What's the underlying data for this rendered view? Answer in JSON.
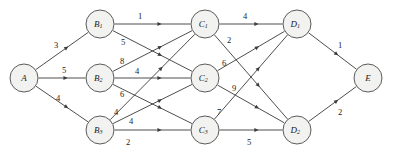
{
  "diagram": {
    "kind": "flow-network",
    "background_color": "#ffffff",
    "node_fill_color": "#f2f2f0",
    "node_stroke_color": "#4a4a4a",
    "edge_color": "#3a3a3a",
    "label_color": "#1a1a1a",
    "nodes": [
      {
        "id": "A",
        "base": "A",
        "subscript": "",
        "label": "A",
        "cx": 24,
        "cy": 78,
        "r": 14,
        "role": "source"
      },
      {
        "id": "B1",
        "base": "B",
        "subscript": "1",
        "label": "B1",
        "cx": 100,
        "cy": 24,
        "r": 14,
        "role": "intermediate"
      },
      {
        "id": "B2",
        "base": "B",
        "subscript": "2",
        "label": "B2",
        "cx": 100,
        "cy": 78,
        "r": 14,
        "role": "intermediate"
      },
      {
        "id": "B3",
        "base": "B",
        "subscript": "3",
        "label": "B3",
        "cx": 100,
        "cy": 130,
        "r": 14,
        "role": "intermediate"
      },
      {
        "id": "C1",
        "base": "C",
        "subscript": "1",
        "label": "C1",
        "cx": 205,
        "cy": 24,
        "r": 14,
        "role": "intermediate"
      },
      {
        "id": "C2",
        "base": "C",
        "subscript": "2",
        "label": "C2",
        "cx": 205,
        "cy": 78,
        "r": 14,
        "role": "intermediate"
      },
      {
        "id": "C3",
        "base": "C",
        "subscript": "3",
        "label": "C3",
        "cx": 205,
        "cy": 130,
        "r": 14,
        "role": "intermediate"
      },
      {
        "id": "D1",
        "base": "D",
        "subscript": "1",
        "label": "D1",
        "cx": 297,
        "cy": 24,
        "r": 14,
        "role": "intermediate"
      },
      {
        "id": "D2",
        "base": "D",
        "subscript": "2",
        "label": "D2",
        "cx": 297,
        "cy": 130,
        "r": 14,
        "role": "intermediate"
      },
      {
        "id": "E",
        "base": "E",
        "subscript": "",
        "label": "E",
        "cx": 368,
        "cy": 78,
        "r": 14,
        "role": "sink"
      }
    ],
    "edges": [
      {
        "from": "A",
        "to": "B1",
        "weight": 3,
        "wx": 56,
        "wy": 45
      },
      {
        "from": "A",
        "to": "B2",
        "weight": 5,
        "wx": 64,
        "wy": 70
      },
      {
        "from": "A",
        "to": "B3",
        "weight": 4,
        "wx": 58,
        "wy": 98
      },
      {
        "from": "B1",
        "to": "C1",
        "weight": 1,
        "wx": 140,
        "wy": 16
      },
      {
        "from": "B1",
        "to": "C2",
        "weight": 5,
        "wx": 123,
        "wy": 42
      },
      {
        "from": "B2",
        "to": "C1",
        "weight": 8,
        "wx": 122,
        "wy": 61
      },
      {
        "from": "B2",
        "to": "C2",
        "weight": 4,
        "wx": 137,
        "wy": 71
      },
      {
        "from": "B2",
        "to": "C3",
        "weight": 6,
        "wx": 122,
        "wy": 94
      },
      {
        "from": "B3",
        "to": "C1",
        "weight": 4,
        "wx": 116,
        "wy": 112
      },
      {
        "from": "B3",
        "to": "C2",
        "weight": 4,
        "wx": 131,
        "wy": 121
      },
      {
        "from": "B3",
        "to": "C3",
        "weight": 2,
        "wx": 128,
        "wy": 142
      },
      {
        "from": "C1",
        "to": "D1",
        "weight": 4,
        "wx": 245,
        "wy": 16
      },
      {
        "from": "C1",
        "to": "D2",
        "weight": 2,
        "wx": 229,
        "wy": 40
      },
      {
        "from": "C2",
        "to": "D1",
        "weight": 6,
        "wx": 224,
        "wy": 63
      },
      {
        "from": "C2",
        "to": "D2",
        "weight": 9,
        "wx": 234,
        "wy": 88
      },
      {
        "from": "C3",
        "to": "D1",
        "weight": 7,
        "wx": 219,
        "wy": 112
      },
      {
        "from": "C3",
        "to": "D2",
        "weight": 5,
        "wx": 249,
        "wy": 142
      },
      {
        "from": "D1",
        "to": "E",
        "weight": 1,
        "wx": 340,
        "wy": 45
      },
      {
        "from": "D2",
        "to": "E",
        "weight": 2,
        "wx": 340,
        "wy": 112
      }
    ]
  }
}
